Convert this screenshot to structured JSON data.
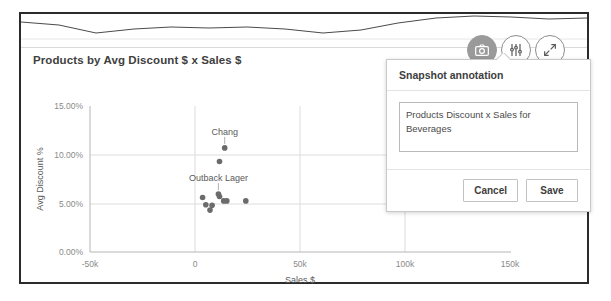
{
  "panel": {
    "chart_title": "Products by Avg Discount $ x Sales $"
  },
  "toolbar": {
    "items": [
      {
        "name": "snapshot-icon",
        "label": "Snapshot",
        "active": true
      },
      {
        "name": "sliders-icon",
        "label": "Chart options",
        "active": false
      },
      {
        "name": "expand-icon",
        "label": "Fullscreen",
        "active": false
      }
    ]
  },
  "popup": {
    "title": "Snapshot annotation",
    "annotation_value": "Products Discount x Sales for Beverages",
    "annotation_placeholder": "Annotation",
    "cancel_label": "Cancel",
    "save_label": "Save"
  },
  "chart_data": {
    "type": "scatter",
    "title": "Products by Avg Discount $ x Sales $",
    "xlabel": "Sales $",
    "ylabel": "Avg Discount %",
    "xlim": [
      -50000,
      150000
    ],
    "ylim": [
      0,
      15
    ],
    "xticks": [
      -50000,
      0,
      50000,
      100000,
      150000
    ],
    "xticklabels": [
      "-50k",
      "0",
      "50k",
      "100k",
      "150k"
    ],
    "yticks": [
      0,
      5,
      10,
      15
    ],
    "yticklabels": [
      "0.00%",
      "5.00%",
      "10.00%",
      "15.00%"
    ],
    "grid": true,
    "legend": false,
    "points": [
      {
        "label": "Chang",
        "x": 14000,
        "y": 10.7,
        "labeled": true
      },
      {
        "label": "",
        "x": 11500,
        "y": 9.3,
        "labeled": false
      },
      {
        "label": "Outback Lager",
        "x": 11000,
        "y": 5.95,
        "labeled": true
      },
      {
        "label": "",
        "x": 11500,
        "y": 5.7,
        "labeled": false
      },
      {
        "label": "",
        "x": 3500,
        "y": 5.6,
        "labeled": false
      },
      {
        "label": "",
        "x": 13500,
        "y": 5.25,
        "labeled": false
      },
      {
        "label": "",
        "x": 15000,
        "y": 5.25,
        "labeled": false
      },
      {
        "label": "",
        "x": 24000,
        "y": 5.25,
        "labeled": false
      },
      {
        "label": "",
        "x": 5000,
        "y": 4.85,
        "labeled": false
      },
      {
        "label": "",
        "x": 8000,
        "y": 4.8,
        "labeled": false
      },
      {
        "label": "",
        "x": 7000,
        "y": 4.3,
        "labeled": false
      }
    ],
    "top_sparkline": {
      "type": "area",
      "values": [
        8.5,
        7.6,
        5.2,
        6.4,
        7.0,
        6.6,
        6.9,
        6.3,
        5.1,
        6.0,
        8.0,
        9.6,
        10.4,
        10.2,
        9.6,
        9.9
      ]
    }
  },
  "colors": {
    "frame": "#2b2b2b",
    "dot": "#6b6b6b",
    "grid": "#dcdcdc",
    "text": "#404040",
    "tick": "#8a8a8a",
    "active_tool": "#9a9a9a"
  }
}
